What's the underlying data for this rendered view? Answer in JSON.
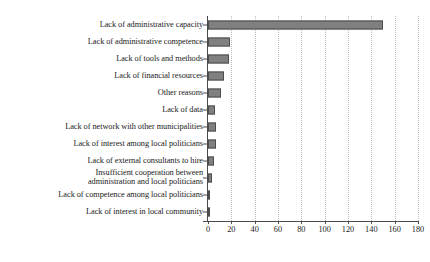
{
  "chart_data": {
    "type": "bar",
    "orientation": "horizontal",
    "title": "",
    "subtitle": "",
    "xlabel": "",
    "ylabel": "",
    "xlim": [
      0,
      180
    ],
    "xticks": [
      0,
      20,
      40,
      60,
      80,
      100,
      120,
      140,
      160,
      180
    ],
    "grid": "vertical-dotted",
    "legend": "none",
    "bar_color": "#808080",
    "bar_edge_color": "#4d4d4d",
    "axis_color": "#4a4a4a",
    "gridline_color": "#bdbdbd",
    "background": "#ffffff",
    "categories": [
      "Lack of administrative capacity",
      "Lack of administrative competence",
      "Lack of tools and methods",
      "Lack of financial resources",
      "Other reasons",
      "Lack of data",
      "Lack of network with other municipalities",
      "Lack of interest among local politicians",
      "Lack of external consultants to hire",
      "Insufficient cooperation between\nadministration and local politicians",
      "Lack of competence among local politicians",
      "Lack of interest in local community"
    ],
    "values": [
      150,
      19,
      18,
      14,
      11,
      6,
      7,
      7,
      5,
      3,
      2,
      2
    ]
  }
}
